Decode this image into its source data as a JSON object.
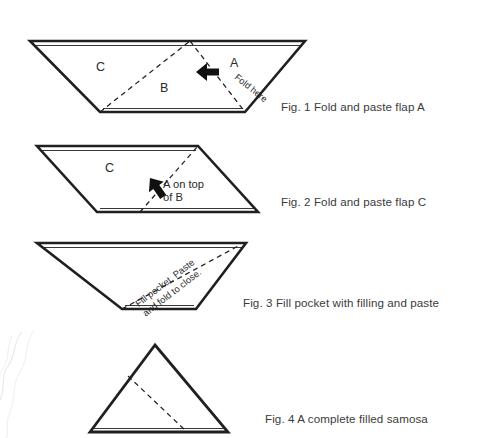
{
  "document": {
    "title": "Samosa folding instructions",
    "background_color": "#ffffff",
    "ink_color": "#231f20",
    "caption_color": "#3b3b3b"
  },
  "figures": [
    {
      "id": "fig-1",
      "caption": "Fig. 1 Fold and paste flap A",
      "shape": "trapezoid",
      "labels": {
        "c": "C",
        "b": "B",
        "a": "A",
        "fold_here": "Fold here"
      },
      "arrow": "left-arrow-icon"
    },
    {
      "id": "fig-2",
      "caption": "Fig. 2 Fold and paste flap C",
      "shape": "parallelogram",
      "labels": {
        "c": "C",
        "a_on_top_of_b": "A on top\nof B"
      },
      "arrow": "down-left-arrow-icon"
    },
    {
      "id": "fig-3",
      "caption": "Fig. 3 Fill pocket with filling and paste",
      "shape": "trapezoid",
      "labels": {
        "fill_pocket": "Fill pocket. Paste\nand fold to close."
      }
    },
    {
      "id": "fig-4",
      "caption": "Fig. 4 A complete filled samosa",
      "shape": "triangle",
      "labels": {}
    }
  ]
}
